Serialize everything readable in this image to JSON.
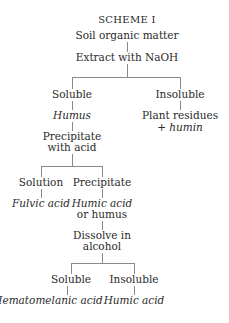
{
  "title": "SCHEME I",
  "nodes": {
    "root": "Soil organic matter",
    "extract": "Extract with NaOH",
    "soluble1": "Soluble",
    "insoluble1": "Insoluble",
    "humus": "Humus",
    "plant_residues_line1": "Plant residues",
    "plant_residues_line2": "+ humin",
    "precipitate_acid_line1": "Precipitate",
    "precipitate_acid_line2": "with acid",
    "solution": "Solution",
    "precipitate": "Precipitate",
    "fulvic_acid": "Fulvic acid",
    "humic_acid_or_humus_line1": "Humic acid",
    "humic_acid_or_humus_line2": "or humus",
    "dissolve_line1": "Dissolve in",
    "dissolve_line2": "alcohol",
    "soluble2": "Soluble",
    "insoluble2": "Insoluble",
    "hematomelanic_acid": "Hematomelanic acid",
    "humic_acid": "Humic acid"
  },
  "colors": {
    "text": "#2a2a2a",
    "lines": "#8a8a8a",
    "background": "#ffffff"
  }
}
